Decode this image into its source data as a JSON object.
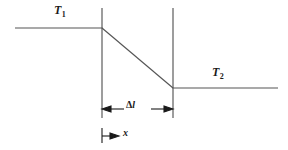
{
  "figure": {
    "type": "thermal-gradient-diagram",
    "background_color": "#ffffff",
    "line_color": "#555555",
    "accent_color": "#1a1a1a",
    "labels": {
      "t1": "T",
      "t1_sub": "1",
      "t2": "T",
      "t2_sub": "2",
      "delta": "Δ",
      "ell": "l",
      "x": "x"
    },
    "geometry": {
      "left_plateau": {
        "x1": 15,
        "y1": 28,
        "x2": 102,
        "y2": 28
      },
      "diagonal": {
        "x1": 102,
        "y1": 28,
        "x2": 173,
        "y2": 88
      },
      "right_plateau": {
        "x1": 173,
        "y1": 88,
        "x2": 278,
        "y2": 88
      },
      "left_vertical": {
        "x": 102,
        "y1": 8,
        "y2": 118
      },
      "right_vertical": {
        "x": 173,
        "y1": 8,
        "y2": 118
      },
      "delta_l_dimension": {
        "y": 109,
        "x1": 102,
        "x2": 173
      },
      "x_dimension": {
        "tick_x": 102,
        "tick_y1": 128,
        "tick_y2": 143,
        "arrow_y": 136,
        "arrow_x2": 119
      }
    }
  }
}
